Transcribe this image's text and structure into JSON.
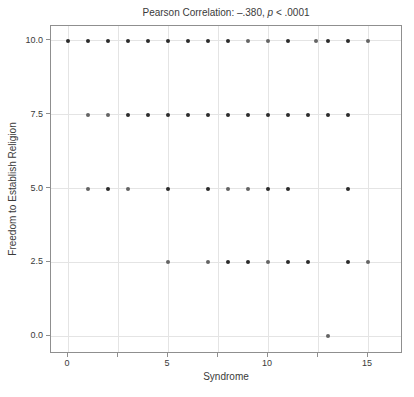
{
  "chart_data": {
    "type": "scatter",
    "title": {
      "prefix": "Pearson Correlation: –.380, ",
      "italic": "p",
      "suffix": " < .0001"
    },
    "xlabel": "Syndrome",
    "ylabel": "Freedom to Establish Religion",
    "xlim": [
      -0.85,
      16.75
    ],
    "ylim": [
      -0.6,
      10.5
    ],
    "grid": true,
    "x_ticks": [
      {
        "value": 0,
        "label": "0"
      },
      {
        "value": 2.5,
        "label": ""
      },
      {
        "value": 5,
        "label": "5"
      },
      {
        "value": 7.5,
        "label": ""
      },
      {
        "value": 10,
        "label": "10"
      },
      {
        "value": 12.5,
        "label": ""
      },
      {
        "value": 15,
        "label": "15"
      }
    ],
    "y_ticks": [
      {
        "value": 0,
        "label": "0.0"
      },
      {
        "value": 2.5,
        "label": "2.5"
      },
      {
        "value": 5,
        "label": "5.0"
      },
      {
        "value": 7.5,
        "label": "7.5"
      },
      {
        "value": 10,
        "label": "10.0"
      }
    ],
    "point_colors": {
      "dark": "#2b2b2b",
      "medium": "#646464"
    },
    "points": [
      {
        "x": 0,
        "y": 10,
        "shade": "dark"
      },
      {
        "x": 1,
        "y": 10,
        "shade": "dark"
      },
      {
        "x": 2,
        "y": 10,
        "shade": "dark"
      },
      {
        "x": 3,
        "y": 10,
        "shade": "dark"
      },
      {
        "x": 4,
        "y": 10,
        "shade": "dark"
      },
      {
        "x": 5,
        "y": 10,
        "shade": "dark"
      },
      {
        "x": 6,
        "y": 10,
        "shade": "dark"
      },
      {
        "x": 7,
        "y": 10,
        "shade": "dark"
      },
      {
        "x": 8,
        "y": 10,
        "shade": "dark"
      },
      {
        "x": 9,
        "y": 10,
        "shade": "medium"
      },
      {
        "x": 10,
        "y": 10,
        "shade": "medium"
      },
      {
        "x": 11,
        "y": 10,
        "shade": "dark"
      },
      {
        "x": 12.4,
        "y": 10,
        "shade": "medium"
      },
      {
        "x": 13,
        "y": 10,
        "shade": "dark"
      },
      {
        "x": 14,
        "y": 10,
        "shade": "dark"
      },
      {
        "x": 15,
        "y": 10,
        "shade": "medium"
      },
      {
        "x": 1,
        "y": 7.5,
        "shade": "medium"
      },
      {
        "x": 2,
        "y": 7.5,
        "shade": "medium"
      },
      {
        "x": 3,
        "y": 7.5,
        "shade": "dark"
      },
      {
        "x": 4,
        "y": 7.5,
        "shade": "dark"
      },
      {
        "x": 5,
        "y": 7.5,
        "shade": "dark"
      },
      {
        "x": 6,
        "y": 7.5,
        "shade": "dark"
      },
      {
        "x": 7,
        "y": 7.5,
        "shade": "dark"
      },
      {
        "x": 8,
        "y": 7.5,
        "shade": "dark"
      },
      {
        "x": 9,
        "y": 7.5,
        "shade": "dark"
      },
      {
        "x": 10,
        "y": 7.5,
        "shade": "dark"
      },
      {
        "x": 11,
        "y": 7.5,
        "shade": "dark"
      },
      {
        "x": 12,
        "y": 7.5,
        "shade": "dark"
      },
      {
        "x": 13,
        "y": 7.5,
        "shade": "dark"
      },
      {
        "x": 14,
        "y": 7.5,
        "shade": "dark"
      },
      {
        "x": 1,
        "y": 5,
        "shade": "medium"
      },
      {
        "x": 2,
        "y": 5,
        "shade": "dark"
      },
      {
        "x": 3,
        "y": 5,
        "shade": "medium"
      },
      {
        "x": 5,
        "y": 5,
        "shade": "dark"
      },
      {
        "x": 7,
        "y": 5,
        "shade": "dark"
      },
      {
        "x": 8,
        "y": 5,
        "shade": "medium"
      },
      {
        "x": 9,
        "y": 5,
        "shade": "medium"
      },
      {
        "x": 10,
        "y": 5,
        "shade": "dark"
      },
      {
        "x": 11,
        "y": 5,
        "shade": "dark"
      },
      {
        "x": 14,
        "y": 5,
        "shade": "dark"
      },
      {
        "x": 5,
        "y": 2.5,
        "shade": "medium"
      },
      {
        "x": 7,
        "y": 2.5,
        "shade": "medium"
      },
      {
        "x": 8,
        "y": 2.5,
        "shade": "dark"
      },
      {
        "x": 9,
        "y": 2.5,
        "shade": "dark"
      },
      {
        "x": 10,
        "y": 2.5,
        "shade": "medium"
      },
      {
        "x": 11,
        "y": 2.5,
        "shade": "dark"
      },
      {
        "x": 12,
        "y": 2.5,
        "shade": "dark"
      },
      {
        "x": 14,
        "y": 2.5,
        "shade": "dark"
      },
      {
        "x": 15,
        "y": 2.5,
        "shade": "medium"
      },
      {
        "x": 13,
        "y": 0,
        "shade": "medium"
      }
    ]
  }
}
